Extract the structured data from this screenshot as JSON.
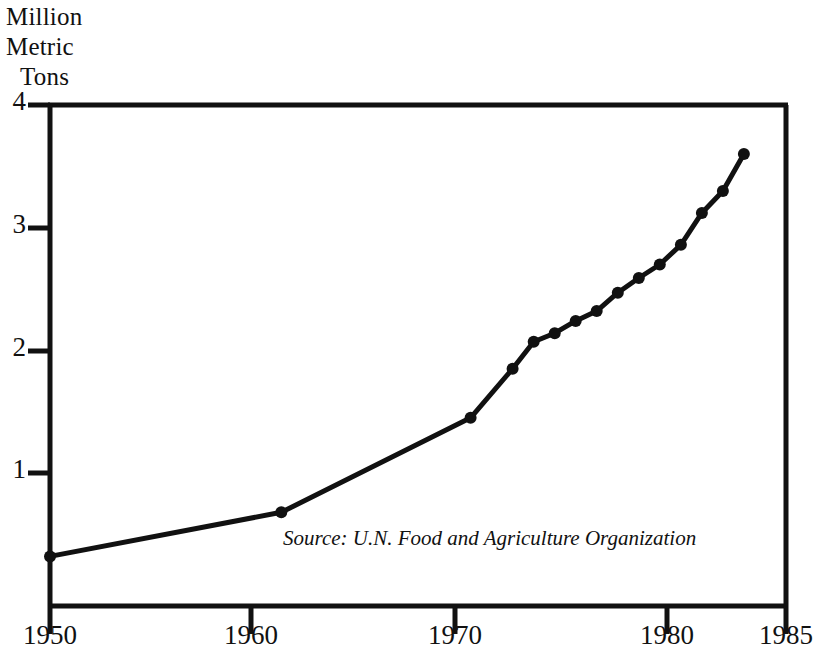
{
  "chart_data": {
    "type": "line",
    "title": "",
    "ylabel": "Million\nMetric\nTons",
    "xlabel": "",
    "xlim": [
      1950,
      1985
    ],
    "ylim": [
      0,
      4
    ],
    "grid": false,
    "legend": null,
    "annotations": [
      {
        "name": "source-note",
        "text": "Source: U.N. Food and Agriculture Organization",
        "style": "italic"
      }
    ],
    "xticks": [
      1950,
      1960,
      1970,
      1980,
      1985
    ],
    "xtick_labels": [
      "1950",
      "1960",
      "1970",
      "1980",
      "1985"
    ],
    "yticks": [
      1,
      2,
      3,
      4
    ],
    "ytick_labels": [
      "1",
      "2",
      "3",
      "4"
    ],
    "marker": "filled-circle",
    "line_color": "#111111",
    "series": [
      {
        "name": "World fish catch",
        "x": [
          1950,
          1961,
          1970,
          1972,
          1973,
          1974,
          1975,
          1976,
          1977,
          1978,
          1979,
          1980,
          1981,
          1982,
          1983
        ],
        "values": [
          0.32,
          0.68,
          1.45,
          1.85,
          2.07,
          2.14,
          2.24,
          2.32,
          2.47,
          2.59,
          2.7,
          2.86,
          3.12,
          3.3,
          3.6
        ]
      }
    ]
  },
  "axis_labels": {
    "y_line_1": "Million",
    "y_line_2": "Metric",
    "y_line_3": "Tons"
  },
  "ticks": {
    "y": [
      {
        "label": "4",
        "value": 4
      },
      {
        "label": "3",
        "value": 3
      },
      {
        "label": "2",
        "value": 2
      },
      {
        "label": "1",
        "value": 1
      }
    ],
    "x": [
      {
        "label": "1950",
        "value": 1950
      },
      {
        "label": "1960",
        "value": 1960
      },
      {
        "label": "1970",
        "value": 1970
      },
      {
        "label": "1980",
        "value": 1980
      },
      {
        "label": "1985",
        "value": 1985
      }
    ]
  },
  "note": {
    "source_text": "Source: U.N. Food and Agriculture Organization"
  },
  "colors": {
    "ink": "#111111",
    "background": "#ffffff"
  }
}
